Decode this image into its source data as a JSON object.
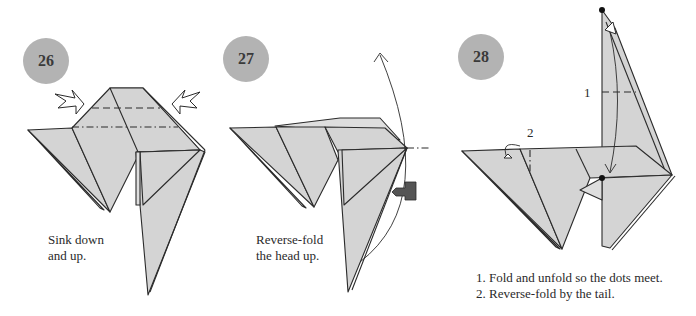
{
  "steps": [
    {
      "number": "26",
      "caption_lines": [
        "Sink down",
        "and up."
      ],
      "fold_lines": [
        "valley",
        "mountain"
      ],
      "arrows": [
        "sink-arrow-left",
        "sink-arrow-right"
      ]
    },
    {
      "number": "27",
      "caption_lines": [
        "Reverse-fold",
        "the head up."
      ],
      "arrows": [
        "curved-arrow-up",
        "push-arrow"
      ]
    },
    {
      "number": "28",
      "callouts": [
        "1",
        "2"
      ],
      "caption_lines": [
        "1. Fold and unfold so the dots meet.",
        "2. Reverse-fold by the tail."
      ]
    }
  ],
  "colors": {
    "paper": "#d4d4d4",
    "badge": "#b3b3b3",
    "outline": "#2b2b2b",
    "push_arrow": "#555555"
  }
}
